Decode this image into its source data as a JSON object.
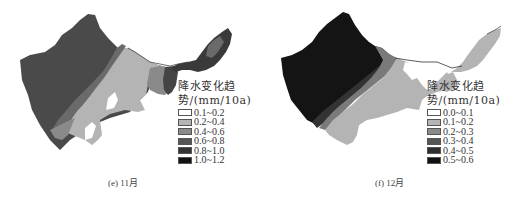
{
  "panels": [
    {
      "id": "e",
      "caption": "(e) 11月",
      "legend": {
        "title_line1": "降水变化趋",
        "title_line2": "势/(mm/10a)",
        "items": [
          {
            "label": "0.1~0.2",
            "color": "#ffffff"
          },
          {
            "label": "0.2~0.4",
            "color": "#b4b4b4"
          },
          {
            "label": "0.4~0.6",
            "color": "#8a8a8a"
          },
          {
            "label": "0.6~0.8",
            "color": "#555555"
          },
          {
            "label": "0.8~1.0",
            "color": "#333333"
          },
          {
            "label": "1.0~1.2",
            "color": "#111111"
          }
        ]
      }
    },
    {
      "id": "f",
      "caption": "(f) 12月",
      "legend": {
        "title_line1": "降水变化趋",
        "title_line2": "势/(mm/10a)",
        "items": [
          {
            "label": "0.0~0.1",
            "color": "#ffffff"
          },
          {
            "label": "0.1~0.2",
            "color": "#b4b4b4"
          },
          {
            "label": "0.2~0.3",
            "color": "#8a8a8a"
          },
          {
            "label": "0.3~0.4",
            "color": "#555555"
          },
          {
            "label": "0.4~0.5",
            "color": "#2e2e2e"
          },
          {
            "label": "0.5~0.6",
            "color": "#111111"
          }
        ]
      }
    }
  ]
}
